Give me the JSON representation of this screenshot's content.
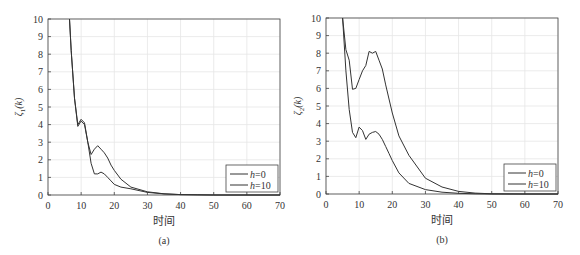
{
  "chart_data": [
    {
      "type": "line",
      "panel": "(a)",
      "xlabel": "时间",
      "ylabel": "ζ1(k)",
      "ylabel_main": "ζ",
      "ylabel_sub": "1",
      "ylabel_arg": "(k)",
      "xlim": [
        0,
        70
      ],
      "ylim": [
        0,
        10
      ],
      "xticks": [
        0,
        10,
        20,
        30,
        40,
        50,
        60,
        70
      ],
      "yticks": [
        0,
        1,
        2,
        3,
        4,
        5,
        6,
        7,
        8,
        9,
        10
      ],
      "grid": true,
      "legend_position": "bottom-right",
      "series": [
        {
          "name": "h=0",
          "x": [
            6.5,
            7,
            8,
            9,
            10,
            11,
            12,
            13,
            14,
            15,
            16,
            17,
            18,
            19,
            20,
            22,
            25,
            30,
            35,
            40,
            45,
            50,
            60,
            70
          ],
          "y": [
            10,
            8.2,
            5.5,
            4.0,
            4.3,
            4.1,
            3.0,
            1.8,
            1.2,
            1.2,
            1.3,
            1.2,
            1.0,
            0.8,
            0.6,
            0.45,
            0.35,
            0.15,
            0.06,
            0.02,
            0.01,
            0.0,
            0.0,
            0.0
          ]
        },
        {
          "name": "h=10",
          "x": [
            6.5,
            7,
            8,
            9,
            10,
            11,
            12,
            13,
            14,
            15,
            16,
            17,
            18,
            19,
            20,
            22,
            25,
            30,
            35,
            40,
            45,
            50,
            60,
            70
          ],
          "y": [
            10,
            8.2,
            5.5,
            3.9,
            4.2,
            4.0,
            3.0,
            2.3,
            2.6,
            2.8,
            2.6,
            2.4,
            2.1,
            1.7,
            1.4,
            0.9,
            0.45,
            0.18,
            0.07,
            0.02,
            0.01,
            0.0,
            0.0,
            0.0
          ]
        }
      ]
    },
    {
      "type": "line",
      "panel": "(b)",
      "xlabel": "时间",
      "ylabel": "ζ2(k)",
      "ylabel_main": "ζ",
      "ylabel_sub": "2",
      "ylabel_arg": "(k)",
      "xlim": [
        0,
        70
      ],
      "ylim": [
        0,
        10
      ],
      "xticks": [
        0,
        10,
        20,
        30,
        40,
        50,
        60,
        70
      ],
      "yticks": [
        0,
        1,
        2,
        3,
        4,
        5,
        6,
        7,
        8,
        9,
        10
      ],
      "grid": true,
      "legend_position": "bottom-right",
      "series": [
        {
          "name": "h=0",
          "x": [
            5,
            6,
            7,
            8,
            9,
            10,
            11,
            12,
            13,
            14,
            15,
            16,
            17,
            18,
            19,
            20,
            22,
            25,
            30,
            35,
            40,
            45,
            50,
            60,
            70
          ],
          "y": [
            10,
            7.0,
            4.8,
            3.5,
            3.2,
            3.8,
            3.6,
            3.1,
            3.4,
            3.5,
            3.55,
            3.4,
            3.1,
            2.7,
            2.3,
            1.9,
            1.2,
            0.6,
            0.25,
            0.1,
            0.04,
            0.01,
            0.0,
            0.0,
            0.0
          ]
        },
        {
          "name": "h=10",
          "x": [
            5,
            6,
            7,
            8,
            9,
            10,
            11,
            12,
            13,
            14,
            15,
            16,
            17,
            18,
            19,
            20,
            22,
            25,
            30,
            35,
            40,
            45,
            50,
            60,
            70
          ],
          "y": [
            10,
            8.2,
            7.6,
            5.95,
            6.0,
            6.5,
            7.0,
            7.3,
            8.1,
            8.0,
            8.1,
            7.6,
            7.1,
            6.2,
            5.4,
            4.6,
            3.3,
            2.2,
            0.9,
            0.4,
            0.15,
            0.05,
            0.01,
            0.0,
            0.0
          ]
        }
      ]
    }
  ],
  "legend": {
    "h_symbol": "h",
    "entries": [
      "=0",
      "=10"
    ]
  }
}
